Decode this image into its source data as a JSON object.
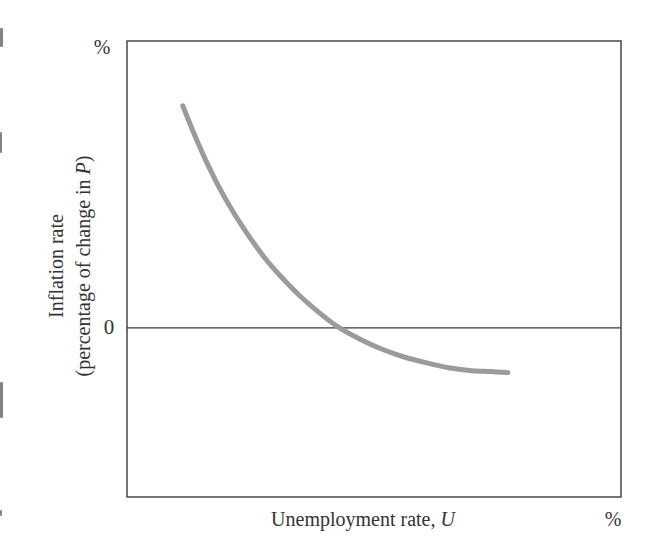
{
  "figure": {
    "background": "#ffffff",
    "axis_color": "#3b3b3b",
    "text_color": "#333333"
  },
  "labels": {
    "y_unit": "%",
    "x_unit": "%",
    "origin": "0",
    "y_axis_line1": "Inflation rate",
    "y_axis_line2_pre": "(percentage of change in ",
    "y_axis_line2_var": "P",
    "y_axis_line2_post": ")",
    "x_axis_pre": "Unemployment rate, ",
    "x_axis_var": "U"
  },
  "chart_data": {
    "type": "line",
    "title": "",
    "xlabel": "Unemployment rate, U",
    "ylabel": "Inflation rate (percentage of change in P)",
    "x_unit": "%",
    "y_unit": "%",
    "xlim": [
      0,
      10
    ],
    "ylim": [
      -3.71,
      6.29
    ],
    "zero_line_y": 0,
    "grid": false,
    "legend": false,
    "axis_labeled_values": [
      "0"
    ],
    "series": [
      {
        "name": "downward-sloping inflation-unemployment curve (Phillips curve)",
        "color": "#9b9b9b",
        "stroke_width": 5,
        "x": [
          1.13,
          1.36,
          1.6,
          1.86,
          2.15,
          2.45,
          2.77,
          3.12,
          3.48,
          3.87,
          4.27,
          4.7,
          5.14,
          5.61,
          6.07,
          6.54,
          6.98,
          7.37,
          7.71
        ],
        "y": [
          4.87,
          4.25,
          3.66,
          3.09,
          2.54,
          2.04,
          1.56,
          1.12,
          0.72,
          0.35,
          0.02,
          -0.24,
          -0.46,
          -0.64,
          -0.77,
          -0.88,
          -0.94,
          -0.96,
          -0.98
        ]
      }
    ],
    "plot_box_px": {
      "left": 127,
      "top": 41,
      "width": 494,
      "height": 456
    },
    "border_stroke_width": 1.4,
    "zero_line_stroke_width": 1.2
  },
  "artifacts": {
    "scan_marks": [
      {
        "x": 0,
        "y": 28,
        "w": 3,
        "h": 19
      },
      {
        "x": 0,
        "y": 132,
        "w": 2,
        "h": 21
      },
      {
        "x": 0,
        "y": 382,
        "w": 3,
        "h": 36
      },
      {
        "x": 0,
        "y": 510,
        "w": 2,
        "h": 6
      }
    ]
  }
}
